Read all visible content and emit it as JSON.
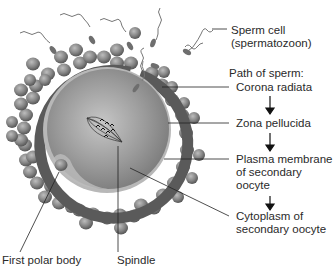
{
  "labels": {
    "sperm_cell_line1": "Sperm cell",
    "sperm_cell_line2": "(spermatozoon)",
    "path_heading": "Path of sperm:",
    "corona_radiata": "Corona radiata",
    "zona_pellucida": "Zona pellucida",
    "plasma_membrane_line1": "Plasma membrane",
    "plasma_membrane_line2": "of secondary",
    "plasma_membrane_line3": "oocyte",
    "cytoplasm_line1": "Cytoplasm of",
    "cytoplasm_line2": "secondary oocyte",
    "bottom_left_cut": "First polar body",
    "bottom_mid_cut": "Spindle"
  },
  "path_of_sperm": [
    "Corona radiata",
    "Zona pellucida",
    "Plasma membrane of secondary oocyte",
    "Cytoplasm of secondary oocyte"
  ],
  "colors": {
    "cytoplasm": "#8e8e8e",
    "zona": "#555555",
    "membrane": "#c8c8c8",
    "corona_cell": "#777777",
    "leader": "#222222"
  }
}
